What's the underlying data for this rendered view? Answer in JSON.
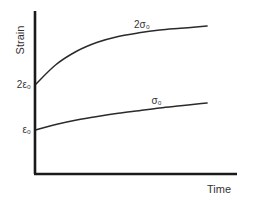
{
  "chart_data": {
    "type": "line",
    "title": "",
    "xlabel": "Time",
    "ylabel": "Strain",
    "xlim": [
      0,
      1
    ],
    "ylim": [
      0,
      3.5
    ],
    "grid": false,
    "legend": "none",
    "y_tick_labels": [
      {
        "value": 1,
        "label": "ε₀"
      },
      {
        "value": 2,
        "label": "2ε₀"
      }
    ],
    "series": [
      {
        "name": "2σ₀",
        "label": "2σ₀",
        "x": [
          0,
          0.1,
          0.2,
          0.3,
          0.4,
          0.5,
          0.6,
          0.7,
          0.8,
          0.83
        ],
        "values": [
          2.0,
          2.45,
          2.75,
          2.95,
          3.08,
          3.16,
          3.22,
          3.26,
          3.3,
          3.31
        ]
      },
      {
        "name": "σ₀",
        "label": "σ₀",
        "x": [
          0,
          0.1,
          0.2,
          0.3,
          0.4,
          0.5,
          0.6,
          0.7,
          0.8,
          0.83
        ],
        "values": [
          1.0,
          1.12,
          1.22,
          1.3,
          1.37,
          1.43,
          1.49,
          1.54,
          1.59,
          1.6
        ]
      }
    ],
    "colors": {
      "axis": "#1a1a1a",
      "curve": "#2a2a2a",
      "text": "#333333"
    }
  }
}
